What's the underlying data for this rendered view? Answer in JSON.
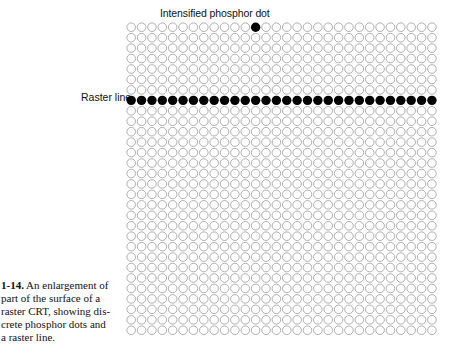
{
  "figure": {
    "top_annotation": "Intensified phosphor dot",
    "side_annotation": "Raster line",
    "caption": {
      "number": "1-14.",
      "lines": [
        "An enlargement of",
        "part of the surface of a",
        "raster CRT, showing dis-",
        "crete phosphor dots and",
        "a raster line."
      ]
    }
  },
  "grid": {
    "columns": 30,
    "rows": 30,
    "pitch_x": 10.37,
    "pitch_y": 10.45,
    "dot_radius": 4.3,
    "outline_color": "#9a9a9a",
    "fill_color": "#000000",
    "raster_line_row": 7,
    "intensified_dot": {
      "row": 0,
      "col": 12
    }
  }
}
